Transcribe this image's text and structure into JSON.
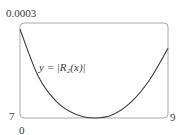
{
  "chart_data": {
    "type": "line",
    "title": "",
    "xlabel": "",
    "ylabel": "",
    "xlim": [
      7,
      9
    ],
    "ylim": [
      0,
      0.0003
    ],
    "tick_labels": {
      "y_top": "0.0003",
      "y_bottom": "0",
      "x_left": "7",
      "x_right": "9"
    },
    "annotation": "y = |R₂(x)|",
    "series": [
      {
        "name": "y = |R2(x)|",
        "x": [
          7.0,
          7.25,
          7.5,
          7.75,
          8.0,
          8.25,
          8.5,
          8.75,
          9.0
        ],
        "y": [
          0.00028,
          0.00013,
          5e-05,
          1.2e-05,
          0.0,
          1e-05,
          5e-05,
          0.00012,
          0.00022
        ]
      }
    ],
    "grid": false,
    "legend": "none",
    "colors": {
      "curve": "#3a3a3a",
      "frame": "#a8a8a8"
    }
  }
}
